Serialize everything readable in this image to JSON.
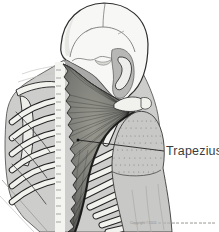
{
  "figure": {
    "muscle_label": "Trapezius",
    "copyright_prefix": "Copyright ©2011"
  },
  "palette": {
    "background": "#ffffff",
    "body": "#cdcdcb",
    "skull": "#f7f7f5",
    "neck_muscle": "#a9a9a7",
    "temporal": "#b7b7b5",
    "bone": "#f1f1ee",
    "muscle_center": "#94948f",
    "muscle_edge": "#4f4f4d",
    "outline": "#2d2d2d",
    "label_text": "#3c3c3c",
    "leader_line": "#222222",
    "copyright_text": "#8f8f8f"
  }
}
